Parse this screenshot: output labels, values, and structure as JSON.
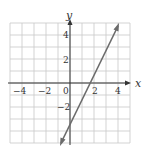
{
  "chart_data": {
    "type": "line",
    "title": "",
    "xlabel": "x",
    "ylabel": "y",
    "xlim": [
      -5,
      5
    ],
    "ylim": [
      -5,
      5
    ],
    "grid": true,
    "x_ticks": [
      -4,
      -2,
      0,
      2,
      4
    ],
    "x_tick_labels": [
      "−4",
      "−2",
      "0",
      "2",
      "4"
    ],
    "y_ticks": [
      4,
      2,
      -2
    ],
    "y_tick_labels": [
      "4",
      "2",
      "−2"
    ],
    "series": [
      {
        "name": "y = 2x − 3",
        "equation": "y = 2x - 3",
        "slope": 2,
        "intercept": -3,
        "points": [
          [
            -1.25,
            -5.5
          ],
          [
            4,
            5
          ]
        ],
        "arrows": "both",
        "color": "#6b6b6b"
      }
    ]
  },
  "colors": {
    "grid": "#c8c8c8",
    "axis": "#333333",
    "line": "#6b6b6b"
  }
}
